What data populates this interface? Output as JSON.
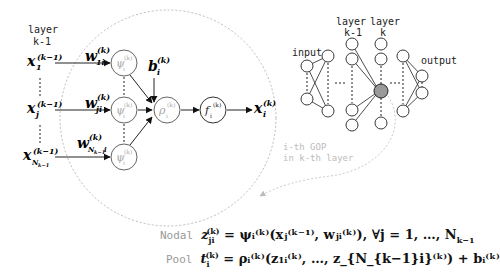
{
  "left_diagram": {
    "layer_label_line1": "layer",
    "layer_label_line2": "k-1",
    "inputs": [
      {
        "base": "x",
        "sub": "1",
        "sup": "(k−1)"
      },
      {
        "base": "x",
        "sub": "j",
        "sup": "(k−1)"
      },
      {
        "base": "x",
        "sub": "N_{k−1}",
        "sup": "(k−1)"
      }
    ],
    "weights": [
      {
        "base": "w",
        "sub": "1i",
        "sup": "(k)"
      },
      {
        "base": "w",
        "sub": "ji",
        "sup": "(k)"
      },
      {
        "base": "w",
        "sub": "N_{k−1}i",
        "sup": "(k)"
      }
    ],
    "nodal_node": {
      "base": "ψ",
      "sub": "i",
      "sup": "(k)"
    },
    "pool_node": {
      "base": "ρ",
      "sub": "i",
      "sup": "(k)"
    },
    "activation_node": {
      "base": "f",
      "sub": "i",
      "sup": "(k)"
    },
    "bias": {
      "base": "b",
      "sub": "i",
      "sup": "(k)"
    },
    "output": {
      "base": "x",
      "sub": "i",
      "sup": "(k)"
    }
  },
  "right_diagram": {
    "input_label": "input",
    "layer_km1_line1": "layer",
    "layer_km1_line2": "k-1",
    "layer_k_line1": "layer",
    "layer_k_line2": "k",
    "output_label": "output",
    "gop_label_line1": "i-th GOP",
    "gop_label_line2": "in k-th layer"
  },
  "equations": {
    "nodal_label": "Nodal",
    "nodal_lhs": "z",
    "nodal_text": "= ψᵢ⁽ᵏ⁾(xⱼ⁽ᵏ⁻¹⁾, wⱼᵢ⁽ᵏ⁾), ∀j = 1, …, N",
    "pool_label": "Pool",
    "pool_text": "= ρᵢ⁽ᵏ⁾(z₁ᵢ⁽ᵏ⁾, …, z_{N_{k−1}i}⁽ᵏ⁾) + bᵢ⁽ᵏ⁾"
  },
  "colors": {
    "line": "#222222",
    "dashed_circle": "#bbbbbb",
    "node_gray": "#888888",
    "highlight_node": "#999999",
    "label_gray": "#999999"
  }
}
